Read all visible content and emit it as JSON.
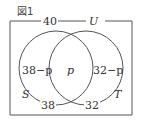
{
  "figure": {
    "caption": "図1",
    "universe_label": "U",
    "universe_count": "40"
  },
  "sets": {
    "S": {
      "label": "S",
      "total": "38"
    },
    "T": {
      "label": "T",
      "total": "32"
    }
  },
  "regions": {
    "s_only": "38−p",
    "intersection": "p",
    "t_only": "32−p"
  },
  "colors": {
    "line": "#555555",
    "text": "#333333",
    "background": "#ffffff"
  }
}
